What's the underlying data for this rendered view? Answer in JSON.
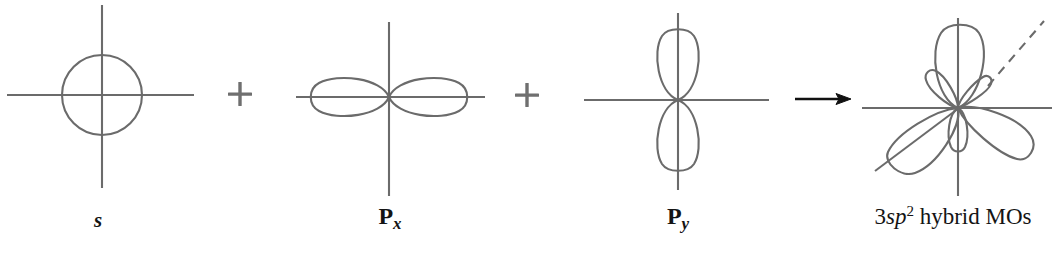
{
  "figure": {
    "background_color": "#ffffff",
    "stroke_color": "#6b6b6b",
    "arrow_color": "#111111",
    "plus_color": "#6f6f6f",
    "width": 1056,
    "height": 260
  },
  "operators": {
    "plus_1": "+",
    "plus_2": "+",
    "arrow": "arrow-right"
  },
  "panels": [
    {
      "id": "s-orbital",
      "label": "s",
      "label_x": 98,
      "label_y": 212,
      "type": "s",
      "center": {
        "x": 102,
        "y": 95
      },
      "circle_radius": 40,
      "axis_h": {
        "x1": 7,
        "x2": 194,
        "y": 95
      },
      "axis_v": {
        "y1": 5,
        "y2": 188,
        "x": 102
      }
    },
    {
      "id": "px-orbital",
      "label_main": "P",
      "label_sub": "x",
      "label_x": 390,
      "label_y": 210,
      "type": "p",
      "orientation": "horizontal",
      "center": {
        "x": 389,
        "y": 97
      },
      "lobe_length": 76,
      "lobe_width": 28,
      "axis_h": {
        "x1": 296,
        "x2": 485,
        "y": 97
      },
      "axis_v": {
        "y1": 22,
        "y2": 196,
        "x": 389
      }
    },
    {
      "id": "py-orbital",
      "label_main": "P",
      "label_sub": "y",
      "label_x": 678,
      "label_y": 210,
      "type": "p",
      "orientation": "vertical",
      "center": {
        "x": 678,
        "y": 100
      },
      "lobe_length": 72,
      "lobe_width": 30,
      "axis_h": {
        "x1": 584,
        "x2": 769,
        "y": 100
      },
      "axis_v": {
        "y1": 13,
        "y2": 190,
        "x": 678
      }
    },
    {
      "id": "sp2-hybrid-orbitals",
      "label_number": "3",
      "label_sp": "sp",
      "label_exponent": "2",
      "label_rest": "hybrid MOs",
      "label_x": 952,
      "label_y": 208,
      "type": "sp2",
      "center": {
        "x": 958,
        "y": 108
      },
      "big_lobe_length": 84,
      "big_lobe_width": 34,
      "small_lobe_length": 34,
      "small_lobe_width": 17,
      "lobe_angles_deg": [
        270,
        30,
        150
      ],
      "axis_h": {
        "x1": 862,
        "x2": 1052,
        "y": 108
      },
      "axis_v": {
        "y1": 18,
        "y2": 196,
        "x": 958
      },
      "diagonal_solid": {
        "x1": 878,
        "y1": 168,
        "x2": 958,
        "y2": 108
      },
      "diagonal_dashed": {
        "x1": 990,
        "y1": 85,
        "x2": 1043,
        "y2": 22
      }
    }
  ],
  "operator_positions": {
    "plus_1": {
      "x": 240,
      "y": 94,
      "size": 22
    },
    "plus_2": {
      "x": 527,
      "y": 95,
      "size": 22
    },
    "arrow": {
      "x1": 795,
      "y": 99,
      "x2": 851
    }
  },
  "artifact": {
    "text": "",
    "x": 600,
    "y": 2
  }
}
